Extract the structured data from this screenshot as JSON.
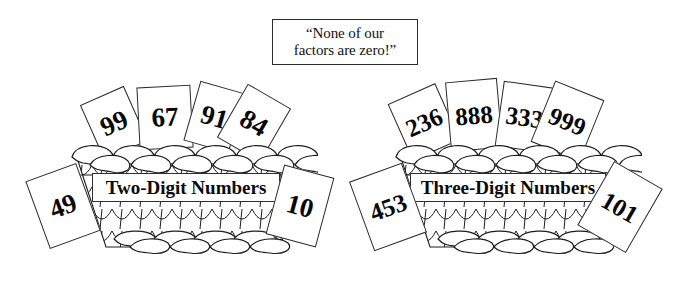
{
  "quote": {
    "name": "speech-callout",
    "text": "“None of our\nfactors are zero!”"
  },
  "colors": {
    "ink": "#111111",
    "outline": "#2b2b2b",
    "paper": "#ffffff"
  },
  "baskets": [
    {
      "id": "two-digit",
      "label": "Two-Digit Numbers",
      "label_left": 92,
      "label_top": 173,
      "label_width": 188,
      "label_height": 29,
      "label_font_size": 19,
      "basket_left": 68,
      "basket_top": 135,
      "cards_inside": [
        {
          "value": "99",
          "left": 90,
          "top": 93,
          "width": 48,
          "height": 60,
          "rotate": -24,
          "text_rotate": -24,
          "font_size": 27
        },
        {
          "value": "67",
          "left": 138,
          "top": 86,
          "width": 54,
          "height": 63,
          "rotate": -3,
          "text_rotate": -3,
          "font_size": 27
        },
        {
          "value": "91",
          "left": 191,
          "top": 86,
          "width": 47,
          "height": 62,
          "rotate": 16,
          "text_rotate": 16,
          "font_size": 27
        },
        {
          "value": "84",
          "left": 229,
          "top": 92,
          "width": 50,
          "height": 62,
          "rotate": 30,
          "text_rotate": 30,
          "font_size": 27
        }
      ],
      "cards_outside": [
        {
          "value": "49",
          "left": 36,
          "top": 170,
          "width": 54,
          "height": 72,
          "rotate": -20,
          "text_rotate": -20,
          "font_size": 27
        },
        {
          "value": "10",
          "left": 274,
          "top": 170,
          "width": 52,
          "height": 72,
          "rotate": 15,
          "text_rotate": 15,
          "font_size": 27
        }
      ]
    },
    {
      "id": "three-digit",
      "label": "Three-Digit Numbers",
      "label_left": 410,
      "label_top": 173,
      "label_width": 196,
      "label_height": 29,
      "label_font_size": 19,
      "basket_left": 392,
      "basket_top": 135,
      "cards_inside": [
        {
          "value": "236",
          "left": 398,
          "top": 91,
          "width": 52,
          "height": 62,
          "rotate": -24,
          "text_rotate": -24,
          "font_size": 25
        },
        {
          "value": "888",
          "left": 448,
          "top": 80,
          "width": 52,
          "height": 70,
          "rotate": -5,
          "text_rotate": -5,
          "font_size": 25
        },
        {
          "value": "333",
          "left": 499,
          "top": 84,
          "width": 51,
          "height": 66,
          "rotate": 8,
          "text_rotate": 8,
          "font_size": 25
        },
        {
          "value": "999",
          "left": 541,
          "top": 88,
          "width": 53,
          "height": 66,
          "rotate": 22,
          "text_rotate": 22,
          "font_size": 25
        }
      ],
      "cards_outside": [
        {
          "value": "453",
          "left": 360,
          "top": 170,
          "width": 56,
          "height": 74,
          "rotate": -20,
          "text_rotate": -20,
          "font_size": 25
        },
        {
          "value": "101",
          "left": 592,
          "top": 170,
          "width": 56,
          "height": 74,
          "rotate": 30,
          "text_rotate": 30,
          "font_size": 25
        }
      ]
    }
  ]
}
